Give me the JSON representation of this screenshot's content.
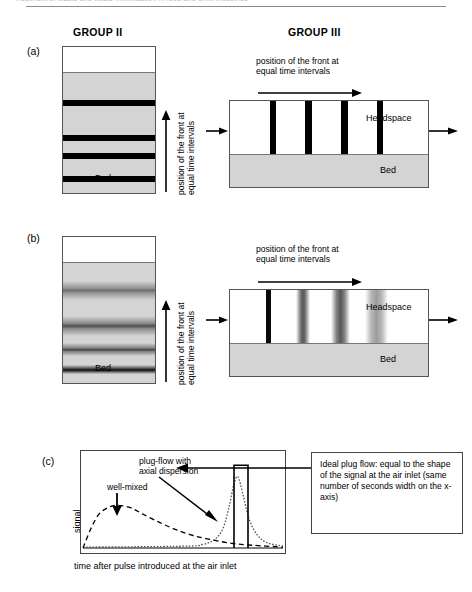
{
  "runninghead": {
    "text": "Treatment of waste and waste minimisation in food and drink industries"
  },
  "headers": {
    "group2": "GROUP II",
    "group3": "GROUP III"
  },
  "panels": {
    "a": {
      "letter": "(a)",
      "group2": {
        "bed_label": "Bed",
        "vertical_caption_line1": "position of the front at",
        "vertical_caption_line2": "equal time intervals",
        "band_positions_pct": [
          36.5,
          60.5,
          72.5,
          88.5
        ],
        "band_thickness_pct": 4.2,
        "gas_height_pct": 17
      },
      "group3": {
        "headspace_label": "Headspace",
        "bed_label": "Bed",
        "caption_line1": "position of the front at",
        "caption_line2": "equal time intervals",
        "band_positions_pct": [
          20,
          38,
          56,
          74
        ],
        "band_width_pct": 3.4,
        "headspace_height_pct": 62
      }
    },
    "b": {
      "letter": "(b)",
      "group2": {
        "bed_label": "Bed",
        "vertical_caption_line1": "position of the front at",
        "vertical_caption_line2": "equal time intervals",
        "band_positions_pct": [
          36.5,
          60.5,
          75.5,
          91.5
        ],
        "gas_height_pct": 17
      },
      "group3": {
        "headspace_label": "Headspace",
        "bed_label": "Bed",
        "caption_line1": "position of the front at",
        "caption_line2": "equal time intervals",
        "band_positions_pct": [
          18,
          37,
          55.5,
          73
        ],
        "headspace_height_pct": 62
      }
    },
    "c": {
      "letter": "(c)",
      "annotations": {
        "wellmixed": "well-mixed",
        "plugflow_line1": "plug-flow with",
        "plugflow_line2": "axial dispersion"
      },
      "ylabel": "signal",
      "xlabel": "time after pulse introduced at the air inlet",
      "sidebox": "Ideal plug flow: equal to the shape of the signal at the air inlet (same number of seconds width on the x-axis)"
    }
  },
  "colors": {
    "bed_gray": "#d4d4d4",
    "band_black": "#000000",
    "outline": "#555555",
    "dispersed_dark": "#6e6e6e",
    "dispersed_mid": "#9a9a9a",
    "dispersed_light": "#c2c2c2"
  },
  "chart_data": {
    "type": "line",
    "title": "",
    "xlabel": "time after pulse introduced at the air inlet",
    "ylabel": "signal",
    "xlim": [
      0,
      1
    ],
    "ylim": [
      0,
      1
    ],
    "grid": false,
    "legend": "annotations-inline",
    "series": [
      {
        "name": "well-mixed",
        "style": "dashed",
        "description": "broad early peak, long tail",
        "x": [
          0.0,
          0.04,
          0.08,
          0.13,
          0.18,
          0.24,
          0.3,
          0.38,
          0.46,
          0.55,
          0.65,
          0.75,
          0.85,
          1.0
        ],
        "y": [
          0.0,
          0.22,
          0.38,
          0.46,
          0.48,
          0.45,
          0.38,
          0.29,
          0.21,
          0.14,
          0.09,
          0.05,
          0.03,
          0.01
        ]
      },
      {
        "name": "plug-flow with axial dispersion",
        "style": "dotted",
        "description": "narrow skewed peak near outlet time",
        "x": [
          0.0,
          0.5,
          0.6,
          0.66,
          0.7,
          0.73,
          0.755,
          0.775,
          0.8,
          0.83,
          0.87,
          0.92,
          1.0
        ],
        "y": [
          0.01,
          0.02,
          0.04,
          0.1,
          0.22,
          0.46,
          0.72,
          0.8,
          0.6,
          0.33,
          0.15,
          0.06,
          0.02
        ]
      },
      {
        "name": "ideal plug flow",
        "style": "solid",
        "description": "rectangular pulse",
        "x": [
          0.755,
          0.755,
          0.825,
          0.825
        ],
        "y": [
          0.0,
          0.93,
          0.93,
          0.0
        ]
      }
    ]
  }
}
